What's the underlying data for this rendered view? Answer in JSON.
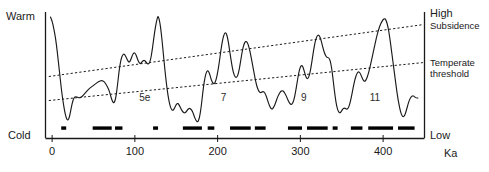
{
  "figure": {
    "axis_labels": {
      "left_top": "Warm",
      "left_bottom": "Cold",
      "right_top": "High",
      "right_bottom": "Low",
      "right_vertical": "Sea level",
      "x_unit": "Ka"
    },
    "annotations": {
      "subsidence": "Subsidence",
      "temperate_line1": "Temperate",
      "temperate_line2": "threshold"
    },
    "stage_labels": [
      {
        "label": "5e",
        "x": 112
      },
      {
        "label": "7",
        "x": 207
      },
      {
        "label": "9",
        "x": 304
      },
      {
        "label": "11",
        "x": 390
      }
    ]
  },
  "chart_data": {
    "type": "line",
    "title": "",
    "subtitle": "",
    "xlabel": "Ka",
    "ylabel": "Sea level",
    "xlim": [
      -8,
      450
    ],
    "ylim": [
      0,
      100
    ],
    "grid": false,
    "legend_position": "none",
    "xticks": [
      0,
      100,
      200,
      300,
      400
    ],
    "xtick_labels": [
      "0",
      "100",
      "200",
      "300",
      "400"
    ],
    "y_axis_left_labels": [
      "Warm",
      "Cold"
    ],
    "y_axis_right_labels": [
      "High",
      "Low"
    ],
    "series": [
      {
        "name": "Sea level / temperature proxy",
        "style": "solid",
        "color": "#1a1a1a",
        "points": [
          [
            -2,
            96
          ],
          [
            0,
            93
          ],
          [
            2,
            87
          ],
          [
            4,
            80
          ],
          [
            6,
            70
          ],
          [
            9,
            52
          ],
          [
            11,
            40
          ],
          [
            13,
            30
          ],
          [
            15,
            22
          ],
          [
            17,
            16
          ],
          [
            19,
            14
          ],
          [
            21,
            17
          ],
          [
            23,
            24
          ],
          [
            25,
            30
          ],
          [
            27,
            33
          ],
          [
            30,
            33
          ],
          [
            33,
            32
          ],
          [
            36,
            33
          ],
          [
            40,
            36
          ],
          [
            44,
            39
          ],
          [
            48,
            41
          ],
          [
            52,
            43
          ],
          [
            56,
            45
          ],
          [
            60,
            46
          ],
          [
            63,
            45
          ],
          [
            66,
            42
          ],
          [
            69,
            38
          ],
          [
            71,
            33
          ],
          [
            73,
            29
          ],
          [
            75,
            28
          ],
          [
            77,
            32
          ],
          [
            79,
            42
          ],
          [
            81,
            54
          ],
          [
            83,
            62
          ],
          [
            85,
            66
          ],
          [
            87,
            67
          ],
          [
            89,
            65
          ],
          [
            91,
            62
          ],
          [
            93,
            60
          ],
          [
            95,
            62
          ],
          [
            97,
            66
          ],
          [
            99,
            68
          ],
          [
            101,
            67
          ],
          [
            103,
            63
          ],
          [
            105,
            60
          ],
          [
            107,
            59
          ],
          [
            109,
            61
          ],
          [
            111,
            62
          ],
          [
            113,
            61
          ],
          [
            115,
            59
          ],
          [
            117,
            59
          ],
          [
            119,
            62
          ],
          [
            121,
            70
          ],
          [
            123,
            80
          ],
          [
            125,
            89
          ],
          [
            127,
            95
          ],
          [
            128,
            97
          ],
          [
            130,
            93
          ],
          [
            132,
            83
          ],
          [
            134,
            70
          ],
          [
            136,
            56
          ],
          [
            138,
            44
          ],
          [
            140,
            34
          ],
          [
            142,
            27
          ],
          [
            144,
            23
          ],
          [
            146,
            22
          ],
          [
            148,
            24
          ],
          [
            150,
            27
          ],
          [
            152,
            28
          ],
          [
            154,
            26
          ],
          [
            156,
            23
          ],
          [
            158,
            21
          ],
          [
            160,
            20
          ],
          [
            162,
            21
          ],
          [
            164,
            23
          ],
          [
            166,
            24
          ],
          [
            168,
            23
          ],
          [
            170,
            21
          ],
          [
            172,
            17
          ],
          [
            174,
            14
          ],
          [
            176,
            13
          ],
          [
            178,
            16
          ],
          [
            180,
            24
          ],
          [
            182,
            36
          ],
          [
            184,
            46
          ],
          [
            186,
            52
          ],
          [
            188,
            54
          ],
          [
            190,
            52
          ],
          [
            192,
            47
          ],
          [
            194,
            44
          ],
          [
            196,
            43
          ],
          [
            198,
            46
          ],
          [
            200,
            52
          ],
          [
            202,
            60
          ],
          [
            204,
            70
          ],
          [
            206,
            78
          ],
          [
            208,
            83
          ],
          [
            210,
            84
          ],
          [
            212,
            80
          ],
          [
            214,
            72
          ],
          [
            216,
            63
          ],
          [
            218,
            55
          ],
          [
            220,
            50
          ],
          [
            222,
            48
          ],
          [
            224,
            49
          ],
          [
            226,
            54
          ],
          [
            228,
            62
          ],
          [
            230,
            70
          ],
          [
            232,
            75
          ],
          [
            234,
            77
          ],
          [
            236,
            76
          ],
          [
            238,
            72
          ],
          [
            240,
            66
          ],
          [
            242,
            59
          ],
          [
            244,
            52
          ],
          [
            246,
            45
          ],
          [
            248,
            40
          ],
          [
            250,
            37
          ],
          [
            252,
            36
          ],
          [
            254,
            37
          ],
          [
            256,
            37
          ],
          [
            258,
            35
          ],
          [
            260,
            31
          ],
          [
            262,
            27
          ],
          [
            264,
            24
          ],
          [
            266,
            23
          ],
          [
            268,
            25
          ],
          [
            270,
            28
          ],
          [
            272,
            32
          ],
          [
            274,
            35
          ],
          [
            276,
            37
          ],
          [
            278,
            38
          ],
          [
            280,
            37
          ],
          [
            282,
            35
          ],
          [
            284,
            32
          ],
          [
            286,
            29
          ],
          [
            288,
            27
          ],
          [
            290,
            27
          ],
          [
            292,
            30
          ],
          [
            294,
            36
          ],
          [
            296,
            44
          ],
          [
            298,
            52
          ],
          [
            300,
            57
          ],
          [
            302,
            58
          ],
          [
            304,
            55
          ],
          [
            306,
            50
          ],
          [
            308,
            47
          ],
          [
            310,
            48
          ],
          [
            312,
            53
          ],
          [
            314,
            61
          ],
          [
            316,
            70
          ],
          [
            318,
            77
          ],
          [
            320,
            81
          ],
          [
            322,
            82
          ],
          [
            324,
            80
          ],
          [
            326,
            75
          ],
          [
            328,
            70
          ],
          [
            330,
            66
          ],
          [
            332,
            64
          ],
          [
            334,
            64
          ],
          [
            336,
            62
          ],
          [
            338,
            55
          ],
          [
            340,
            44
          ],
          [
            342,
            33
          ],
          [
            344,
            25
          ],
          [
            346,
            21
          ],
          [
            348,
            20
          ],
          [
            350,
            22
          ],
          [
            352,
            24
          ],
          [
            354,
            24
          ],
          [
            356,
            23
          ],
          [
            358,
            24
          ],
          [
            360,
            28
          ],
          [
            362,
            34
          ],
          [
            364,
            41
          ],
          [
            366,
            47
          ],
          [
            368,
            51
          ],
          [
            370,
            53
          ],
          [
            372,
            52
          ],
          [
            374,
            49
          ],
          [
            376,
            46
          ],
          [
            378,
            45
          ],
          [
            380,
            47
          ],
          [
            382,
            51
          ],
          [
            384,
            56
          ],
          [
            386,
            62
          ],
          [
            388,
            68
          ],
          [
            390,
            74
          ],
          [
            392,
            80
          ],
          [
            394,
            85
          ],
          [
            396,
            89
          ],
          [
            398,
            92
          ],
          [
            400,
            94
          ],
          [
            402,
            95
          ],
          [
            404,
            93
          ],
          [
            406,
            88
          ],
          [
            408,
            80
          ],
          [
            410,
            70
          ],
          [
            412,
            60
          ],
          [
            414,
            50
          ],
          [
            416,
            40
          ],
          [
            418,
            31
          ],
          [
            420,
            24
          ],
          [
            422,
            19
          ],
          [
            424,
            17
          ],
          [
            426,
            18
          ],
          [
            428,
            22
          ],
          [
            430,
            27
          ],
          [
            432,
            31
          ],
          [
            434,
            33
          ],
          [
            436,
            34
          ],
          [
            438,
            33
          ],
          [
            440,
            32
          ],
          [
            442,
            32
          ]
        ]
      }
    ],
    "trend_lines": [
      {
        "name": "Subsidence",
        "style": "dotted",
        "color": "#1a1a1a",
        "x": [
          -4,
          448
        ],
        "y": [
          49,
          90
        ]
      },
      {
        "name": "Temperate threshold",
        "style": "dotted",
        "color": "#1a1a1a",
        "x": [
          -4,
          448
        ],
        "y": [
          30,
          60
        ]
      }
    ],
    "marker_bars": {
      "name": "Warm / interglacial intervals",
      "color": "#000000",
      "y_level": 8,
      "intervals": [
        [
          11,
          17
        ],
        [
          49,
          72
        ],
        [
          76,
          85
        ],
        [
          122,
          128
        ],
        [
          158,
          181
        ],
        [
          188,
          196
        ],
        [
          215,
          240
        ],
        [
          245,
          258
        ],
        [
          285,
          302
        ],
        [
          308,
          333
        ],
        [
          339,
          345
        ],
        [
          361,
          375
        ],
        [
          382,
          412
        ],
        [
          418,
          438
        ]
      ]
    }
  }
}
